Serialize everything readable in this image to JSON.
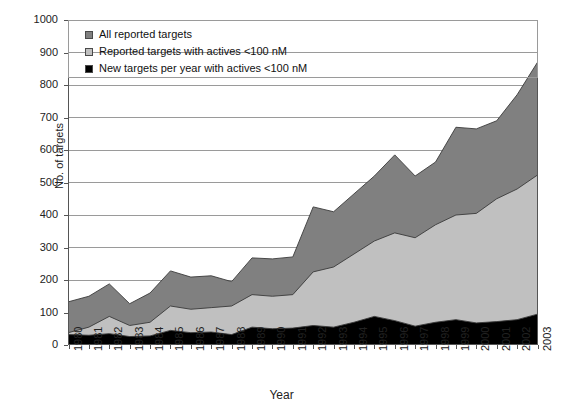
{
  "axes": {
    "ylabel": "No. of targets",
    "xlabel": "Year",
    "yticks": [
      "0",
      "100",
      "200",
      "300",
      "400",
      "500",
      "600",
      "700",
      "800",
      "900",
      "1000"
    ],
    "xticks": [
      "1980",
      "1981",
      "1982",
      "1983",
      "1984",
      "1985",
      "1986",
      "1987",
      "1988",
      "1989",
      "1990",
      "1991",
      "1992",
      "1993",
      "1994",
      "1995",
      "1996",
      "1997",
      "1998",
      "1999",
      "2000",
      "2001",
      "2002",
      "2003"
    ]
  },
  "legend": {
    "items": [
      {
        "label": "All reported targets",
        "color": "#808080"
      },
      {
        "label": "Reported targets with actives <100 nM",
        "color": "#c0c0c0"
      },
      {
        "label": "New targets per year with actives <100 nM",
        "color": "#000000"
      }
    ]
  },
  "colors": {
    "all_reported": "#808080",
    "reported_actives": "#c0c0c0",
    "new_per_year": "#000000",
    "grid": "#9a9a9a",
    "axis": "#555555",
    "outline": "#3a3a3a"
  },
  "chart_data": {
    "type": "area",
    "title": "",
    "xlabel": "Year",
    "ylabel": "No. of targets",
    "ylim": [
      0,
      1000
    ],
    "grid": true,
    "legend_position": "top-inside",
    "stacked": false,
    "x": [
      1980,
      1981,
      1982,
      1983,
      1984,
      1985,
      1986,
      1987,
      1988,
      1989,
      1990,
      1991,
      1992,
      1993,
      1994,
      1995,
      1996,
      1997,
      1998,
      1999,
      2000,
      2001,
      2002,
      2003
    ],
    "series": [
      {
        "name": "All reported targets",
        "color": "#808080",
        "values": [
          133,
          150,
          188,
          127,
          160,
          228,
          209,
          213,
          195,
          268,
          265,
          271,
          425,
          410,
          465,
          520,
          585,
          520,
          563,
          670,
          665,
          690,
          770,
          870
        ]
      },
      {
        "name": "Reported targets with actives <100 nM",
        "color": "#c0c0c0",
        "values": [
          38,
          55,
          88,
          60,
          70,
          120,
          110,
          115,
          120,
          155,
          150,
          155,
          225,
          240,
          280,
          320,
          345,
          330,
          370,
          400,
          405,
          450,
          480,
          523
        ]
      },
      {
        "name": "New targets per year with actives <100 nM",
        "color": "#000000",
        "values": [
          32,
          30,
          35,
          26,
          28,
          45,
          38,
          40,
          32,
          55,
          50,
          52,
          60,
          55,
          70,
          88,
          75,
          58,
          70,
          78,
          68,
          72,
          78,
          95
        ]
      }
    ]
  }
}
